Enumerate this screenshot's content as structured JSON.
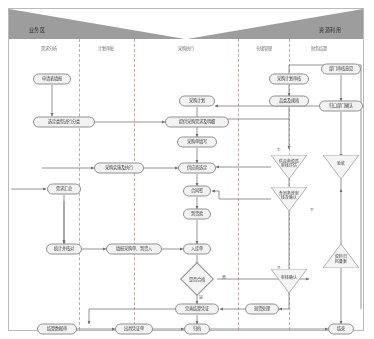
{
  "diagram": {
    "title_left": "业务区",
    "title_right": "资源利用",
    "lanes": [
      {
        "id": "lane1",
        "label": "需求分析"
      },
      {
        "id": "lane2",
        "label": "计划审批"
      },
      {
        "id": "lane3",
        "label": "采购执行"
      },
      {
        "id": "lane4",
        "label": "仓储管理"
      },
      {
        "id": "lane5",
        "label": "财务结算"
      }
    ],
    "nodes": [
      {
        "id": "n1",
        "type": "rounded",
        "label": "申请表填报",
        "x": 43,
        "y": 70,
        "w": 38
      },
      {
        "id": "n2",
        "type": "rounded",
        "label": "选定类型进行分类",
        "x": 55,
        "y": 113,
        "w": 62
      },
      {
        "id": "n3",
        "type": "rounded",
        "label": "采购计划",
        "x": 188,
        "y": 92,
        "w": 36
      },
      {
        "id": "n4",
        "type": "rounded",
        "label": "提供采购需求及明细",
        "x": 188,
        "y": 113,
        "w": 64
      },
      {
        "id": "n5",
        "type": "rounded",
        "label": "采购单填写",
        "x": 188,
        "y": 133,
        "w": 40
      },
      {
        "id": "n6",
        "type": "rounded",
        "label": "采购计划审核",
        "x": 280,
        "y": 70,
        "w": 40
      },
      {
        "id": "n7",
        "type": "rounded",
        "label": "品类及规格",
        "x": 280,
        "y": 92,
        "w": 40
      },
      {
        "id": "n8",
        "type": "rounded",
        "label": "部门审核意见",
        "x": 332,
        "y": 60,
        "w": 40
      },
      {
        "id": "n9",
        "type": "rounded",
        "label": "归口部门确认",
        "x": 332,
        "y": 97,
        "w": 44
      },
      {
        "id": "n10",
        "type": "rounded",
        "label": "采购实施及执行",
        "x": 110,
        "y": 159,
        "w": 50
      },
      {
        "id": "n11",
        "type": "rounded",
        "label": "供应商选定",
        "x": 188,
        "y": 159,
        "w": 38
      },
      {
        "id": "n12",
        "type": "rounded",
        "label": "合同签",
        "x": 188,
        "y": 182,
        "w": 28
      },
      {
        "id": "n13",
        "type": "rounded",
        "label": "到货验",
        "x": 188,
        "y": 205,
        "w": 28
      },
      {
        "id": "n14",
        "type": "rounded",
        "label": "需求汇总",
        "x": 55,
        "y": 180,
        "w": 34
      },
      {
        "id": "n15",
        "type": "rounded",
        "label": "统计并核对",
        "x": 55,
        "y": 240,
        "w": 36
      },
      {
        "id": "n16",
        "type": "rounded",
        "label": "填报采购单、到货入",
        "x": 125,
        "y": 240,
        "w": 56
      },
      {
        "id": "n17",
        "type": "rounded",
        "label": "入库单",
        "x": 188,
        "y": 240,
        "w": 28
      },
      {
        "id": "n18",
        "type": "diamond",
        "label": "是否合格",
        "x": 188,
        "y": 270,
        "w": 40
      },
      {
        "id": "n19",
        "type": "rounded",
        "label": "完善结算凭证",
        "x": 188,
        "y": 300,
        "w": 44
      },
      {
        "id": "n20",
        "type": "rounded",
        "label": "退货处理",
        "x": 253,
        "y": 300,
        "w": 34
      },
      {
        "id": "n21",
        "type": "rounded",
        "label": "结算数据审",
        "x": 48,
        "y": 320,
        "w": 40
      },
      {
        "id": "n22",
        "type": "rounded",
        "label": "出具凭证单",
        "x": 125,
        "y": 320,
        "w": 38
      },
      {
        "id": "n23",
        "type": "rounded",
        "label": "归档",
        "x": 188,
        "y": 320,
        "w": 26
      },
      {
        "id": "n24",
        "type": "rounded",
        "label": "结束",
        "x": 332,
        "y": 320,
        "w": 26
      },
      {
        "id": "n25",
        "type": "tri-down",
        "label": "供应商资质\n审核评估",
        "x": 280,
        "y": 158,
        "w": 38
      },
      {
        "id": "n26",
        "type": "tri-down",
        "label": "合同条款审\n核及确认",
        "x": 280,
        "y": 190,
        "w": 38
      },
      {
        "id": "n27",
        "type": "tri-down",
        "label": "验收",
        "x": 332,
        "y": 158,
        "w": 36
      },
      {
        "id": "n28",
        "type": "tri-up",
        "label": "资料归\n档备案",
        "x": 332,
        "y": 247,
        "w": 36
      },
      {
        "id": "n29",
        "type": "tri-down",
        "label": "审核确认",
        "x": 280,
        "y": 272,
        "w": 36
      }
    ],
    "edge_labels": [
      {
        "id": "e1",
        "text": "否",
        "x": 215,
        "y": 268
      },
      {
        "id": "e2",
        "text": "是",
        "x": 192,
        "y": 288
      },
      {
        "id": "e3",
        "text": "①",
        "x": 270,
        "y": 140
      },
      {
        "id": "e4",
        "text": "②",
        "x": 303,
        "y": 200
      },
      {
        "id": "e5",
        "text": "③",
        "x": 270,
        "y": 258
      }
    ],
    "colors": {
      "band": "#9d9d9d",
      "node_fill": "#f2f2f2",
      "node_stroke": "#8f8f8f",
      "divider": "#c9a9a9",
      "frame": "#b9b9b9",
      "wire": "#7a7a7a"
    }
  }
}
